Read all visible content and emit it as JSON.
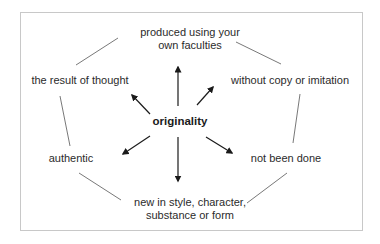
{
  "diagram": {
    "center": {
      "label": "originality"
    },
    "nodes": [
      {
        "id": "faculties",
        "lines": [
          "produced using your",
          "own faculties"
        ]
      },
      {
        "id": "thought",
        "lines": [
          "the result of thought"
        ]
      },
      {
        "id": "copy",
        "lines": [
          "without copy or imitation"
        ]
      },
      {
        "id": "authentic",
        "lines": [
          "authentic"
        ]
      },
      {
        "id": "done",
        "lines": [
          "not been done"
        ]
      },
      {
        "id": "new",
        "lines": [
          "new in style, character,",
          "substance or form"
        ]
      }
    ],
    "arrows": [
      {
        "from": "originality",
        "to": "produced using your own faculties"
      },
      {
        "from": "originality",
        "to": "the result of thought"
      },
      {
        "from": "originality",
        "to": "without copy or imitation"
      },
      {
        "from": "originality",
        "to": "authentic"
      },
      {
        "from": "originality",
        "to": "not been done"
      },
      {
        "from": "originality",
        "to": "new in style, character, substance or form"
      }
    ],
    "connectors": [
      [
        "the result of thought",
        "produced using your own faculties"
      ],
      [
        "produced using your own faculties",
        "without copy or imitation"
      ],
      [
        "the result of thought",
        "authentic"
      ],
      [
        "without copy or imitation",
        "not been done"
      ],
      [
        "authentic",
        "new in style, character, substance or form"
      ],
      [
        "not been done",
        "new in style, character, substance or form"
      ]
    ],
    "colors": {
      "frame_border": "#c8c8c8",
      "connector": "#555555",
      "arrow": "#1a1a1a",
      "text": "#2b2b2b"
    }
  }
}
